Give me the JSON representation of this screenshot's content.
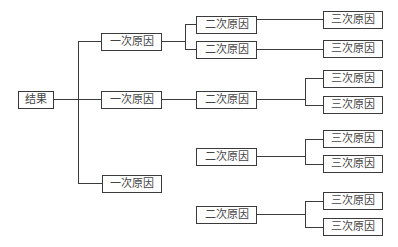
{
  "diagram": {
    "type": "tree",
    "root": {
      "label": "结果"
    },
    "level1": [
      {
        "label": "一次原因"
      },
      {
        "label": "一次原因"
      },
      {
        "label": "一次原因"
      }
    ],
    "level2": [
      {
        "label": "二次原因",
        "parent": 0
      },
      {
        "label": "二次原因",
        "parent": 0
      },
      {
        "label": "二次原因",
        "parent": 1
      },
      {
        "label": "二次原因",
        "parent": 1
      },
      {
        "label": "二次原因",
        "parent": 1
      }
    ],
    "level3": [
      {
        "label": "三次原因",
        "parent": 0
      },
      {
        "label": "三次原因",
        "parent": 1
      },
      {
        "label": "三次原因",
        "parent": 2
      },
      {
        "label": "三次原因",
        "parent": 2
      },
      {
        "label": "三次原因",
        "parent": 3
      },
      {
        "label": "三次原因",
        "parent": 3
      },
      {
        "label": "三次原因",
        "parent": 4
      },
      {
        "label": "三次原因",
        "parent": 4
      }
    ]
  }
}
